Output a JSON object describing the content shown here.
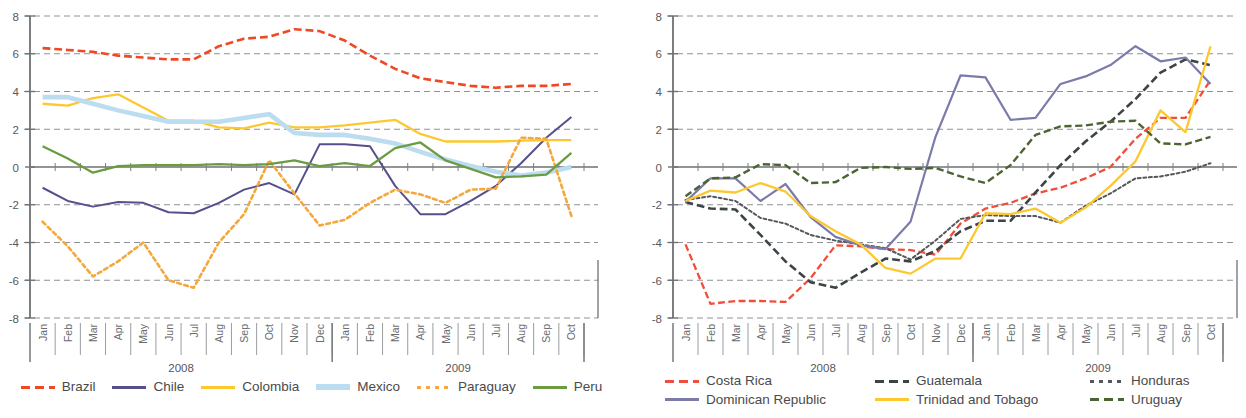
{
  "chart_data": [
    {
      "type": "line",
      "title": "",
      "xlabel": "",
      "ylabel": "",
      "ylim": [
        -8,
        8
      ],
      "yticks": [
        8,
        6,
        4,
        2,
        0,
        -2,
        -4,
        -6,
        -8
      ],
      "grid": "horizontal dashed",
      "legend_position": "bottom",
      "year_groups": [
        {
          "label": "2008",
          "months": [
            "Jan",
            "Feb",
            "Mar",
            "Apr",
            "May",
            "Jun",
            "Jul",
            "Aug",
            "Sep",
            "Oct",
            "Nov",
            "Dec"
          ]
        },
        {
          "label": "2009",
          "months": [
            "Jan",
            "Feb",
            "Mar",
            "Apr",
            "May",
            "Jun",
            "Jul",
            "Aug",
            "Sep",
            "Oct"
          ]
        }
      ],
      "categories": [
        "Jan",
        "Feb",
        "Mar",
        "Apr",
        "May",
        "Jun",
        "Jul",
        "Aug",
        "Sep",
        "Oct",
        "Nov",
        "Dec",
        "Jan",
        "Feb",
        "Mar",
        "Apr",
        "May",
        "Jun",
        "Jul",
        "Aug",
        "Sep",
        "Oct"
      ],
      "series": [
        {
          "name": "Brazil",
          "color": "#ef4824",
          "style": "dashed",
          "width": 2.6,
          "values": [
            6.3,
            6.2,
            6.1,
            5.9,
            5.8,
            5.7,
            5.7,
            6.4,
            6.8,
            6.9,
            7.3,
            7.2,
            6.7,
            5.9,
            5.2,
            4.7,
            4.5,
            4.3,
            4.2,
            4.3,
            4.3,
            4.4
          ]
        },
        {
          "name": "Chile",
          "color": "#55508b",
          "style": "solid",
          "width": 2.0,
          "values": [
            -1.1,
            -1.8,
            -2.1,
            -1.85,
            -1.9,
            -2.4,
            -2.45,
            -1.9,
            -1.2,
            -0.85,
            -1.45,
            1.2,
            1.2,
            1.1,
            -1.0,
            -2.5,
            -2.5,
            -1.8,
            -1.0,
            0.2,
            1.55,
            2.65
          ]
        },
        {
          "name": "Colombia",
          "color": "#fdc82f",
          "style": "solid",
          "width": 2.3,
          "values": [
            3.35,
            3.25,
            3.65,
            3.85,
            3.15,
            2.45,
            2.45,
            2.1,
            2.05,
            2.35,
            2.1,
            2.1,
            2.2,
            2.35,
            2.5,
            1.75,
            1.35,
            1.35,
            1.35,
            1.4,
            1.42,
            1.42
          ]
        },
        {
          "name": "Mexico",
          "color": "#bcdcf0",
          "style": "solid",
          "width": 4.6,
          "values": [
            3.7,
            3.7,
            3.35,
            3.0,
            2.7,
            2.4,
            2.4,
            2.4,
            2.6,
            2.8,
            1.8,
            1.7,
            1.7,
            1.5,
            1.25,
            0.8,
            0.4,
            0.05,
            -0.25,
            -0.45,
            -0.3,
            0.0
          ]
        },
        {
          "name": "Paraguay",
          "color": "#f4a83c",
          "style": "dotted",
          "width": 2.6,
          "values": [
            -2.9,
            -4.2,
            -5.8,
            -5.0,
            -4.0,
            -6.0,
            -6.4,
            -4.0,
            -2.5,
            0.35,
            -1.4,
            -3.1,
            -2.8,
            -1.9,
            -1.2,
            -1.45,
            -1.9,
            -1.2,
            -1.15,
            1.55,
            1.5,
            -2.6
          ]
        },
        {
          "name": "Peru",
          "color": "#6b9b42",
          "style": "solid",
          "width": 2.3,
          "values": [
            1.1,
            0.45,
            -0.3,
            0.05,
            0.1,
            0.1,
            0.1,
            0.15,
            0.1,
            0.15,
            0.35,
            0.05,
            0.2,
            0.05,
            1.0,
            1.3,
            0.35,
            -0.1,
            -0.55,
            -0.5,
            -0.4,
            0.75
          ]
        }
      ]
    },
    {
      "type": "line",
      "title": "",
      "xlabel": "",
      "ylabel": "",
      "ylim": [
        -8,
        8
      ],
      "yticks": [
        8,
        6,
        4,
        2,
        0,
        -2,
        -4,
        -6,
        -8
      ],
      "grid": "horizontal dashed",
      "legend_position": "bottom",
      "year_groups": [
        {
          "label": "2008",
          "months": [
            "Jan",
            "Feb",
            "Mar",
            "Apr",
            "May",
            "Jun",
            "Jul",
            "Aug",
            "Sep",
            "Oct",
            "Nov",
            "Dec"
          ]
        },
        {
          "label": "2009",
          "months": [
            "Jan",
            "Feb",
            "Mar",
            "Apr",
            "May",
            "Jun",
            "Jul",
            "Aug",
            "Sep",
            "Oct"
          ]
        }
      ],
      "categories": [
        "Jan",
        "Feb",
        "Mar",
        "Apr",
        "May",
        "Jun",
        "Jul",
        "Aug",
        "Sep",
        "Oct",
        "Nov",
        "Dec",
        "Jan",
        "Feb",
        "Mar",
        "Apr",
        "May",
        "Jun",
        "Jul",
        "Aug",
        "Sep",
        "Oct"
      ],
      "series": [
        {
          "name": "Costa Rica",
          "color": "#ef4f3a",
          "style": "dashed",
          "width": 2.3,
          "values": [
            -4.1,
            -7.25,
            -7.1,
            -7.1,
            -7.15,
            -5.9,
            -4.15,
            -4.2,
            -4.35,
            -4.4,
            -4.65,
            -3.0,
            -2.2,
            -1.9,
            -1.4,
            -1.1,
            -0.6,
            0.0,
            1.5,
            2.6,
            2.6,
            4.6
          ]
        },
        {
          "name": "Guatemala",
          "color": "#3d4445",
          "style": "dashed",
          "width": 2.6,
          "values": [
            -1.85,
            -2.2,
            -2.25,
            -3.6,
            -5.0,
            -6.1,
            -6.4,
            -5.6,
            -4.85,
            -5.0,
            -4.45,
            -3.4,
            -2.85,
            -2.85,
            -1.35,
            0.1,
            1.35,
            2.4,
            3.6,
            5.0,
            5.7,
            5.4
          ]
        },
        {
          "name": "Honduras",
          "color": "#55585a",
          "style": "dotted",
          "width": 2.0,
          "values": [
            -1.75,
            -1.55,
            -1.8,
            -2.7,
            -3.0,
            -3.6,
            -3.9,
            -4.1,
            -4.3,
            -4.9,
            -3.9,
            -2.75,
            -2.55,
            -2.6,
            -2.6,
            -2.95,
            -2.05,
            -1.4,
            -0.6,
            -0.5,
            -0.25,
            0.2
          ]
        },
        {
          "name": "Dominican Republic",
          "color": "#7b7bab",
          "style": "solid",
          "width": 2.2,
          "values": [
            -1.85,
            -0.6,
            -0.6,
            -1.8,
            -0.9,
            -2.65,
            -3.7,
            -4.15,
            -4.35,
            -2.9,
            1.6,
            4.85,
            4.75,
            2.5,
            2.6,
            4.4,
            4.8,
            5.4,
            6.4,
            5.6,
            5.8,
            4.4
          ]
        },
        {
          "name": "Trinidad and Tobago",
          "color": "#fdc82f",
          "style": "solid",
          "width": 2.3,
          "values": [
            -1.8,
            -1.25,
            -1.35,
            -0.85,
            -1.3,
            -2.6,
            -3.4,
            -4.1,
            -5.35,
            -5.65,
            -4.85,
            -4.85,
            -2.45,
            -2.5,
            -2.2,
            -2.95,
            -2.15,
            -1.0,
            0.3,
            3.0,
            1.85,
            6.4
          ]
        },
        {
          "name": "Uruguay",
          "color": "#4d6334",
          "style": "dashed",
          "width": 2.4,
          "values": [
            -1.55,
            -0.6,
            -0.55,
            0.15,
            0.1,
            -0.85,
            -0.8,
            -0.05,
            0.0,
            -0.1,
            -0.05,
            -0.5,
            -0.85,
            0.1,
            1.7,
            2.15,
            2.2,
            2.4,
            2.45,
            1.25,
            1.2,
            1.6
          ]
        }
      ]
    }
  ],
  "legends": {
    "left": [
      {
        "label": "Brazil",
        "color": "#ef4824",
        "style": "dashed"
      },
      {
        "label": "Chile",
        "color": "#55508b",
        "style": "solid"
      },
      {
        "label": "Colombia",
        "color": "#fdc82f",
        "style": "solid"
      },
      {
        "label": "Mexico",
        "color": "#bcdcf0",
        "style": "solid-thick"
      },
      {
        "label": "Paraguay",
        "color": "#f4a83c",
        "style": "dotted"
      },
      {
        "label": "Peru",
        "color": "#6b9b42",
        "style": "solid"
      }
    ],
    "right": [
      {
        "label": "Costa Rica",
        "color": "#ef4f3a",
        "style": "dashed"
      },
      {
        "label": "Guatemala",
        "color": "#3d4445",
        "style": "dashed"
      },
      {
        "label": "Honduras",
        "color": "#55585a",
        "style": "dotted"
      },
      {
        "label": "Dominican Republic",
        "color": "#7b7bab",
        "style": "solid"
      },
      {
        "label": "Trinidad and Tobago",
        "color": "#fdc82f",
        "style": "solid"
      },
      {
        "label": "Uruguay",
        "color": "#4d6334",
        "style": "dashed"
      }
    ]
  }
}
